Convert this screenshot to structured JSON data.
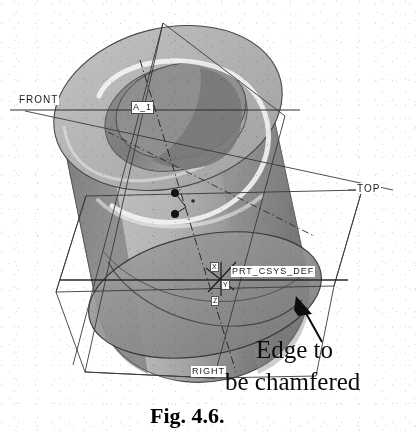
{
  "figure": {
    "caption": "Fig. 4.6.",
    "annotation_line1": "Edge to",
    "annotation_line2": "be chamfered"
  },
  "cad": {
    "datum_planes": [
      {
        "name": "front-plane",
        "label": "FRONT"
      },
      {
        "name": "top-plane",
        "label": "TOP"
      },
      {
        "name": "right-plane",
        "label": "RIGHT"
      }
    ],
    "axis_label": "A_1",
    "coord_system_label": "PRT_CSYS_DEF",
    "coord_axes": [
      {
        "name": "x-axis-tag",
        "label": "X"
      },
      {
        "name": "y-axis-tag",
        "label": "Y"
      },
      {
        "name": "z-axis-tag",
        "label": "Z"
      }
    ],
    "model": "hollow-cylinder-tube"
  },
  "colors": {
    "page_background": "#ffffff",
    "body_light": "#c9c9c9",
    "body_mid": "#a8a8a8",
    "body_dark": "#6f6f6f",
    "body_darkest": "#4e4e4e",
    "bore_shadow": "#8a8a8a",
    "highlight": "#f2f2f2",
    "line": "#2a2a2a",
    "datum_line": "#3a3a3a",
    "text": "#0d0d0d"
  }
}
